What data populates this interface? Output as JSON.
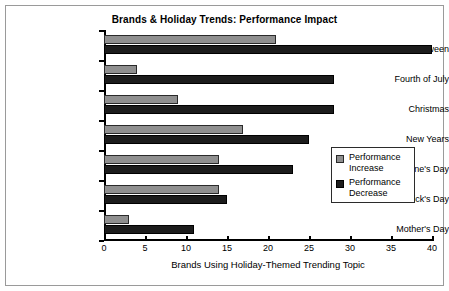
{
  "chart_data": {
    "type": "bar",
    "orientation": "horizontal",
    "title": "Brands & Holiday Trends: Performance Impact",
    "xlabel": "Brands Using Holiday-Themed Trending Topic",
    "ylabel": "",
    "categories": [
      "Halloween",
      "Fourth of July",
      "Christmas",
      "New Years",
      "Valentine's Day",
      "St. Patrick's Day",
      "Mother's Day"
    ],
    "series": [
      {
        "name": "Performance Increase",
        "color": "#8f8f8f",
        "values": [
          21,
          4,
          9,
          17,
          14,
          14,
          3
        ]
      },
      {
        "name": "Performance Decrease",
        "color": "#1c1c1c",
        "values": [
          40,
          28,
          28,
          25,
          23,
          15,
          11
        ]
      }
    ],
    "xlim": [
      0,
      40
    ],
    "xticks": [
      0,
      5,
      10,
      15,
      20,
      25,
      30,
      35,
      40
    ],
    "grid": false,
    "legend_position": "center-right"
  },
  "legend": {
    "entries": [
      {
        "label_line1": "Performance",
        "label_line2": "Increase"
      },
      {
        "label_line1": "Performance",
        "label_line2": "Decrease"
      }
    ]
  }
}
